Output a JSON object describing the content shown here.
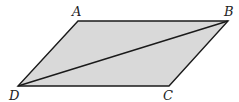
{
  "diagram": {
    "type": "parallelogram-with-diagonal",
    "colors": {
      "fill": "#d9d9d9",
      "stroke": "#1a1a1a",
      "label": "#222222"
    },
    "vertices": [
      {
        "name": "A",
        "x": 78,
        "y": 21,
        "label_x": 72,
        "label_y": 16
      },
      {
        "name": "B",
        "x": 228,
        "y": 21,
        "label_x": 224,
        "label_y": 16
      },
      {
        "name": "C",
        "x": 169,
        "y": 86,
        "label_x": 163,
        "label_y": 100
      },
      {
        "name": "D",
        "x": 18,
        "y": 86,
        "label_x": 9,
        "label_y": 100
      }
    ],
    "diagonal": {
      "from": "D",
      "to": "B"
    }
  }
}
